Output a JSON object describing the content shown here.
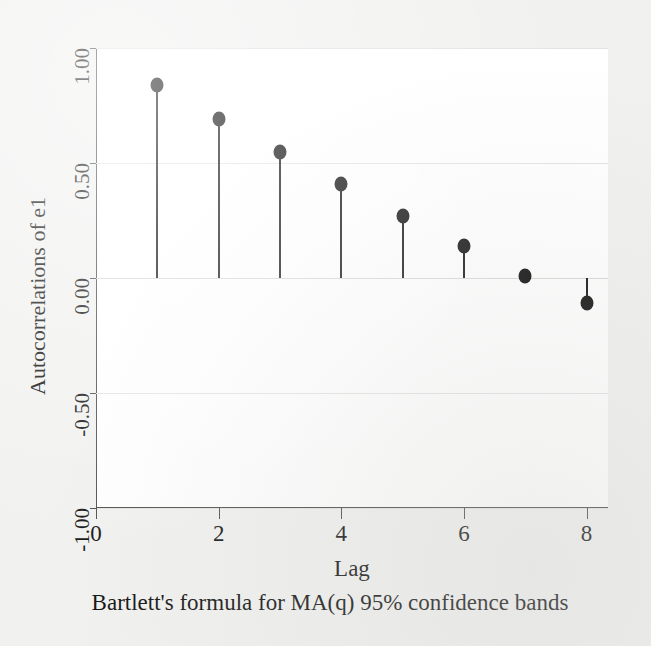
{
  "figure": {
    "background_color": "#f1f1f0",
    "plot_background_color": "#ffffff",
    "axis_color": "#4a4a4a",
    "grid_color": "#e3e3e3",
    "marker_color": "#0d0d0d"
  },
  "chart_data": {
    "type": "scatter",
    "variant": "stem-correlogram",
    "title": "",
    "subtitle": "",
    "xlabel": "Lag",
    "ylabel": "Autocorrelations of e1",
    "note": "Bartlett's formula for MA(q) 95% confidence bands",
    "x": [
      1,
      2,
      3,
      4,
      5,
      6,
      7,
      8
    ],
    "values": [
      0.84,
      0.69,
      0.55,
      0.41,
      0.27,
      0.14,
      0.01,
      -0.11
    ],
    "series": [
      {
        "name": "Autocorrelations of e1",
        "values": [
          0.84,
          0.69,
          0.55,
          0.41,
          0.27,
          0.14,
          0.01,
          -0.11
        ]
      }
    ],
    "xlim": [
      0,
      8.35
    ],
    "ylim": [
      -1.0,
      1.0
    ],
    "xticks": [
      0,
      2,
      4,
      6,
      8
    ],
    "xticklabels": [
      "0",
      "2",
      "4",
      "6",
      "8"
    ],
    "yticks": [
      1.0,
      0.5,
      0.0,
      -0.5,
      -1.0
    ],
    "yticklabels": [
      "1.00",
      "0.50",
      "0.00",
      "-0.50",
      "-1.00"
    ],
    "grid": true,
    "grid_axis": "y",
    "legend": false,
    "legend_position": "none",
    "baseline": 0.0,
    "marker_shape": "circle",
    "annotations": []
  }
}
